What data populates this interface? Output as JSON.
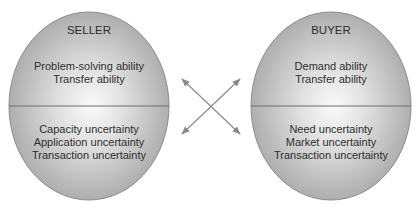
{
  "diagram": {
    "seller": {
      "title": "SELLER",
      "abilities": [
        "Problem-solving ability",
        "Transfer ability"
      ],
      "uncertainties": [
        "Capacity uncertainty",
        "Application uncertainty",
        "Transaction uncertainty"
      ]
    },
    "buyer": {
      "title": "BUYER",
      "abilities": [
        "Demand ability",
        "Transfer ability"
      ],
      "uncertainties": [
        "Need uncertainty",
        "Market uncertainty",
        "Transaction uncertainty"
      ]
    },
    "connector": {
      "type": "crossed-double-arrows",
      "icon": "cross-arrows-icon"
    },
    "colors": {
      "ellipse_edge": "#a6a6a6",
      "ellipse_center": "#f7f7f7",
      "outline": "#8c8c8c",
      "divider": "#6e6e6e",
      "arrow": "#8a8a8a",
      "text": "#2e2e2e"
    }
  }
}
